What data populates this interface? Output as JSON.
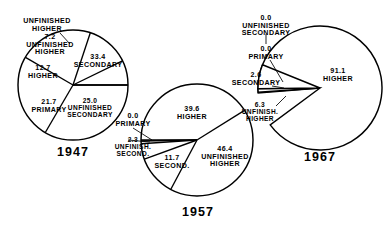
{
  "figure": {
    "type": "pie-chart-set",
    "background": "#ffffff",
    "stroke_color": "#000000",
    "charts": [
      {
        "id": "chart-1947",
        "year_label": "1947",
        "cx": 73,
        "cy": 85,
        "r": 55,
        "year_x": 73,
        "year_y": 152,
        "start_angle_deg": 0,
        "slices": [
          {
            "name": "SECONDARY",
            "value": "33.4",
            "pct": 33.4,
            "label_x": 98,
            "label_y": 62,
            "inside": true,
            "size": "sz7"
          },
          {
            "name": "UNFINISHED\nSECONDARY",
            "value": "25.0",
            "pct": 25.0,
            "label_x": 90,
            "label_y": 108,
            "inside": true,
            "size": "sz65"
          },
          {
            "name": "PRIMARY",
            "value": "21.7",
            "pct": 21.7,
            "label_x": 49,
            "label_y": 107,
            "inside": true,
            "size": "sz7"
          },
          {
            "name": "HIGHER",
            "value": "12.7",
            "pct": 12.7,
            "label_x": 43,
            "label_y": 73,
            "inside": true,
            "size": "sz7"
          },
          {
            "name": "UNFINISHED\nHIGHER",
            "value": "7.2",
            "pct": 7.2,
            "label_x": 50,
            "label_y": 45,
            "inside": true,
            "size": "sz7"
          },
          {
            "name": "PRIMARY",
            "value": "0.0",
            "pct": 0.0,
            "label_x": 133,
            "label_y": 121,
            "inside": false,
            "size": "sz7"
          },
          {
            "name": "UNFINISH.\nSECOND.",
            "value": "2.3",
            "pct": 2.3,
            "label_x": 133,
            "label_y": 147,
            "inside": false,
            "size": "sz65"
          }
        ],
        "callout_top": {
          "text": "UNFINISHED\nHIGHER",
          "x": 47,
          "y": 26,
          "size": "sz7"
        }
      },
      {
        "id": "chart-1957",
        "year_label": "1957",
        "cx": 197,
        "cy": 140,
        "r": 56,
        "year_x": 198,
        "year_y": 212,
        "slices": [
          {
            "name": "UNFINISHED\nHIGHER",
            "value": "46.4",
            "pct": 46.4,
            "label_x": 225,
            "label_y": 157,
            "inside": true,
            "size": "sz7"
          },
          {
            "name": "SECOND.",
            "value": "11.7",
            "pct": 11.7,
            "label_x": 172,
            "label_y": 163,
            "inside": true,
            "size": "sz7"
          },
          {
            "name": "HIGHER",
            "value": "39.6",
            "pct": 39.6,
            "label_x": 192,
            "label_y": 114,
            "inside": true,
            "size": "sz7"
          }
        ]
      },
      {
        "id": "chart-1967",
        "year_label": "1967",
        "cx": 320,
        "cy": 88,
        "r": 62,
        "year_x": 320,
        "year_y": 157,
        "slices": [
          {
            "name": "HIGHER",
            "value": "91.1",
            "pct": 91.1,
            "label_x": 338,
            "label_y": 76,
            "inside": true,
            "size": "sz7"
          },
          {
            "name": "UNFINISH.\nHIGHER",
            "value": "6.3",
            "pct": 6.3,
            "label_x": 260,
            "label_y": 112,
            "inside": false,
            "size": "sz65"
          },
          {
            "name": "SECONDARY",
            "value": "2.6",
            "pct": 2.6,
            "label_x": 256,
            "label_y": 80,
            "inside": false,
            "size": "sz7"
          },
          {
            "name": "PRIMARY",
            "value": "0.0",
            "pct": 0.0,
            "label_x": 266,
            "label_y": 54,
            "inside": false,
            "size": "sz7"
          },
          {
            "name": "UNFINISHED\nSECONDARY",
            "value": "0.0",
            "pct": 0.0,
            "label_x": 266,
            "label_y": 26,
            "inside": false,
            "size": "sz7"
          }
        ]
      }
    ]
  },
  "chart_data": {
    "type": "pie",
    "title": "",
    "subtitle": "",
    "xlabel": "",
    "ylabel": "",
    "legend_position": "none",
    "grid": false,
    "units": "percent",
    "categories": [
      "PRIMARY",
      "UNFINISHED SECONDARY",
      "SECONDARY",
      "UNFINISHED HIGHER",
      "HIGHER"
    ],
    "series": [
      {
        "name": "1947",
        "values": [
          21.7,
          25.0,
          33.4,
          7.2,
          12.7
        ]
      },
      {
        "name": "1957",
        "values": [
          0.0,
          2.3,
          11.7,
          46.4,
          39.6
        ]
      },
      {
        "name": "1967",
        "values": [
          0.0,
          0.0,
          2.6,
          6.3,
          91.1
        ]
      }
    ],
    "annotations": [
      "1947: 33.4 SECONDARY",
      "1947: 25.0 UNFINISHED SECONDARY",
      "1947: 21.7 PRIMARY",
      "1947: 12.7 HIGHER",
      "1947: 7.2 UNFINISHED HIGHER",
      "1947: 0.0 PRIMARY",
      "1947: 2.3 UNFINISH. SECOND.",
      "1957: 39.6 HIGHER",
      "1957: 46.4 UNFINISHED HIGHER",
      "1957: 11.7 SECOND.",
      "1967: 91.1 HIGHER",
      "1967: 6.3 UNFINISH. HIGHER",
      "1967: 2.6 SECONDARY",
      "1967: 0.0 PRIMARY",
      "1967: 0.0 UNFINISHED SECONDARY"
    ]
  }
}
